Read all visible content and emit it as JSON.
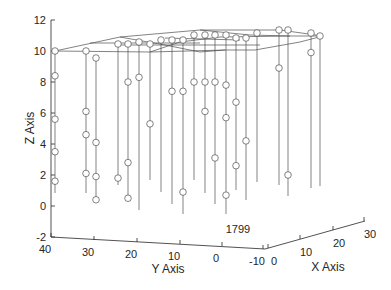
{
  "chart_data": {
    "type": "scatter",
    "subtype": "stem3",
    "title": "",
    "xlabel": "X Axis",
    "ylabel": "Y Axis",
    "zlabel": "Z Axis",
    "xlim": [
      -10,
      30
    ],
    "ylim": [
      -10,
      40
    ],
    "zlim": [
      -2,
      12
    ],
    "x_ticks": [
      "0",
      "10",
      "20",
      "30"
    ],
    "y_ticks": [
      "40",
      "30",
      "20",
      "10",
      "0",
      "-10"
    ],
    "z_ticks": [
      "12",
      "10",
      "8",
      "6",
      "4",
      "2",
      "0",
      "-2"
    ],
    "grid": false,
    "annotations": [
      {
        "text": "1799",
        "position": "bottom-center"
      }
    ],
    "marker": "open-circle",
    "line_color": "#4d4d4d",
    "stems": [
      {
        "x_px": 55,
        "base_y": 193,
        "top_y": 51,
        "markers_z": [
          10.0,
          8.4,
          5.6,
          3.5,
          1.6
        ]
      },
      {
        "x_px": 86,
        "base_y": 193,
        "top_y": 51,
        "markers_z": [
          10.0,
          6.1,
          4.6,
          2.1
        ]
      },
      {
        "x_px": 96,
        "base_y": 202,
        "top_y": 58,
        "markers_z": [
          9.6,
          4.1,
          1.9,
          0.4
        ]
      },
      {
        "x_px": 118,
        "base_y": 185,
        "top_y": 44,
        "markers_z": [
          10.5,
          1.8
        ]
      },
      {
        "x_px": 128,
        "base_y": 198,
        "top_y": 44,
        "markers_z": [
          10.3,
          8.0,
          2.8,
          0.5
        ]
      },
      {
        "x_px": 139,
        "base_y": 210,
        "top_y": 42,
        "markers_z": [
          10.5,
          8.3
        ]
      },
      {
        "x_px": 150,
        "base_y": 180,
        "top_y": 44,
        "markers_z": [
          10.4,
          5.3
        ]
      },
      {
        "x_px": 161,
        "base_y": 192,
        "top_y": 40,
        "markers_z": [
          10.6
        ]
      },
      {
        "x_px": 172,
        "base_y": 204,
        "top_y": 40,
        "markers_z": [
          10.5,
          7.4
        ]
      },
      {
        "x_px": 183,
        "base_y": 214,
        "top_y": 40,
        "markers_z": [
          10.4,
          7.4,
          0.9
        ]
      },
      {
        "x_px": 194,
        "base_y": 180,
        "top_y": 35,
        "markers_z": [
          10.7,
          8.0
        ]
      },
      {
        "x_px": 205,
        "base_y": 193,
        "top_y": 35,
        "markers_z": [
          10.7,
          8.0,
          6.1
        ]
      },
      {
        "x_px": 215,
        "base_y": 204,
        "top_y": 35,
        "markers_z": [
          10.8,
          8.0,
          3.1
        ]
      },
      {
        "x_px": 226,
        "base_y": 214,
        "top_y": 35,
        "markers_z": [
          10.8,
          7.8,
          5.7,
          0.7
        ]
      },
      {
        "x_px": 236,
        "base_y": 190,
        "top_y": 38,
        "markers_z": [
          10.7,
          6.7,
          2.6
        ]
      },
      {
        "x_px": 246,
        "base_y": 200,
        "top_y": 38,
        "markers_z": [
          10.6,
          4.2
        ]
      },
      {
        "x_px": 257,
        "base_y": 182,
        "top_y": 33,
        "markers_z": [
          10.9
        ]
      },
      {
        "x_px": 279,
        "base_y": 185,
        "top_y": 30,
        "markers_z": [
          11.0,
          8.9
        ]
      },
      {
        "x_px": 288,
        "base_y": 196,
        "top_y": 30,
        "markers_z": [
          11.0,
          2.0
        ]
      },
      {
        "x_px": 311,
        "base_y": 188,
        "top_y": 33,
        "markers_z": [
          11.0,
          9.9
        ]
      },
      {
        "x_px": 320,
        "base_y": 186,
        "top_y": 36,
        "markers_z": [
          10.9
        ]
      }
    ]
  },
  "annotation_text": "1799"
}
